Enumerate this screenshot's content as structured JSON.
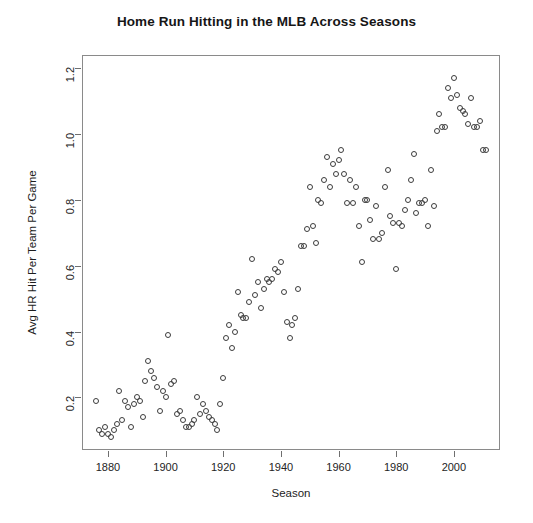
{
  "chart_data": {
    "type": "scatter",
    "title": "Home Run Hitting in the MLB Across Seasons",
    "xlabel": "Season",
    "ylabel": "Avg HR Hit Per Team Per Game",
    "xlim": [
      1871,
      2016
    ],
    "ylim": [
      0.04,
      1.24
    ],
    "xticks": [
      1880,
      1900,
      1920,
      1940,
      1960,
      1980,
      2000
    ],
    "xtick_labels": [
      "1880",
      "1900",
      "1920",
      "1940",
      "1960",
      "1980",
      "2000"
    ],
    "yticks": [
      0.2,
      0.4,
      0.6,
      0.8,
      1.0,
      1.2
    ],
    "ytick_labels": [
      "0.2",
      "0.4",
      "0.6",
      "0.8",
      "1.0",
      "1.2"
    ],
    "grid": false,
    "legend": null,
    "marker": "open-circle",
    "marker_color": "#3c3c3c",
    "series_name": "Avg HR Hit Per Team Per Game",
    "x": [
      1876,
      1877,
      1878,
      1879,
      1880,
      1881,
      1882,
      1883,
      1884,
      1885,
      1886,
      1887,
      1888,
      1889,
      1890,
      1891,
      1892,
      1893,
      1894,
      1895,
      1896,
      1897,
      1898,
      1899,
      1900,
      1901,
      1902,
      1903,
      1904,
      1905,
      1906,
      1907,
      1908,
      1909,
      1910,
      1911,
      1912,
      1913,
      1914,
      1915,
      1916,
      1917,
      1918,
      1919,
      1920,
      1921,
      1922,
      1923,
      1924,
      1925,
      1926,
      1927,
      1928,
      1929,
      1930,
      1931,
      1932,
      1933,
      1934,
      1935,
      1936,
      1937,
      1938,
      1939,
      1940,
      1941,
      1942,
      1943,
      1944,
      1945,
      1946,
      1947,
      1948,
      1949,
      1950,
      1951,
      1952,
      1953,
      1954,
      1955,
      1956,
      1957,
      1958,
      1959,
      1960,
      1961,
      1962,
      1963,
      1964,
      1965,
      1966,
      1967,
      1968,
      1969,
      1970,
      1971,
      1972,
      1973,
      1974,
      1975,
      1976,
      1977,
      1978,
      1979,
      1980,
      1981,
      1982,
      1983,
      1984,
      1985,
      1986,
      1987,
      1988,
      1989,
      1990,
      1991,
      1992,
      1993,
      1994,
      1995,
      1996,
      1997,
      1998,
      1999,
      2000,
      2001,
      2002,
      2003,
      2004,
      2005,
      2006,
      2007,
      2008,
      2009,
      2010,
      2011
    ],
    "y": [
      0.19,
      0.1,
      0.09,
      0.11,
      0.09,
      0.08,
      0.1,
      0.12,
      0.22,
      0.13,
      0.19,
      0.17,
      0.11,
      0.18,
      0.2,
      0.19,
      0.14,
      0.25,
      0.31,
      0.28,
      0.26,
      0.23,
      0.16,
      0.22,
      0.2,
      0.39,
      0.24,
      0.25,
      0.15,
      0.16,
      0.13,
      0.11,
      0.11,
      0.12,
      0.13,
      0.2,
      0.15,
      0.18,
      0.16,
      0.14,
      0.13,
      0.12,
      0.1,
      0.18,
      0.26,
      0.38,
      0.42,
      0.35,
      0.4,
      0.52,
      0.45,
      0.44,
      0.44,
      0.49,
      0.62,
      0.51,
      0.55,
      0.47,
      0.53,
      0.56,
      0.55,
      0.56,
      0.59,
      0.58,
      0.61,
      0.52,
      0.43,
      0.38,
      0.42,
      0.44,
      0.53,
      0.66,
      0.66,
      0.71,
      0.84,
      0.72,
      0.67,
      0.8,
      0.79,
      0.86,
      0.93,
      0.84,
      0.91,
      0.88,
      0.92,
      0.95,
      0.88,
      0.79,
      0.86,
      0.79,
      0.84,
      0.72,
      0.61,
      0.8,
      0.8,
      0.74,
      0.68,
      0.78,
      0.68,
      0.7,
      0.84,
      0.89,
      0.75,
      0.73,
      0.59,
      0.73,
      0.72,
      0.77,
      0.8,
      0.86,
      0.94,
      0.76,
      0.79,
      0.79,
      0.8,
      0.72,
      0.89,
      0.78,
      1.01,
      1.06,
      1.02,
      1.02,
      1.14,
      1.11,
      1.17,
      1.12,
      1.08,
      1.07,
      1.06,
      1.03,
      1.11,
      1.02,
      1.02,
      1.04,
      0.95,
      0.95,
      0.94
    ]
  },
  "axes": {
    "plot_left_px": 82,
    "plot_top_px": 55,
    "plot_right_px": 500,
    "plot_bottom_px": 450
  }
}
